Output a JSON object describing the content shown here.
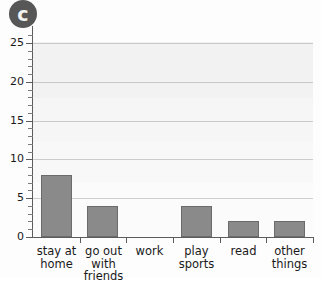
{
  "badge": {
    "label": "c",
    "name": "part-label-c"
  },
  "chart_data": {
    "type": "bar",
    "title": "",
    "subtitle": "",
    "xlabel": "",
    "ylabel": "",
    "categories": [
      "stay at home",
      "go out with friends",
      "work",
      "play sports",
      "read",
      "other things"
    ],
    "category_lines": [
      [
        "stay at",
        "home"
      ],
      [
        "go out",
        "with",
        "friends"
      ],
      [
        "work"
      ],
      [
        "play",
        "sports"
      ],
      [
        "read"
      ],
      [
        "other",
        "things"
      ]
    ],
    "values": [
      8,
      4,
      0,
      4,
      2,
      2
    ],
    "ylim": [
      0,
      25
    ],
    "ytick_labels": [
      "0",
      "5",
      "10",
      "15",
      "20",
      "25"
    ],
    "ytick_values": [
      0,
      5,
      10,
      15,
      20,
      25
    ],
    "minor_tick_step": 1,
    "grid": "horizontal",
    "legend": "none",
    "bar_color": "#8a8a8a",
    "bar_edge_color": "#6b6b6b",
    "gridline_color": "#cfcfcf",
    "axis_color": "#5c5c5c",
    "plot_background": "#fbfbfb"
  }
}
